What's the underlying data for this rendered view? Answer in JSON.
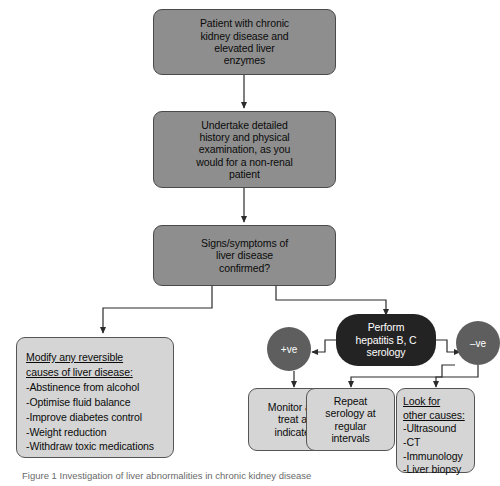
{
  "diagram": {
    "colors": {
      "node_dark_fill": "#8e8e8e",
      "node_light_fill": "#d5d5d5",
      "node_black_fill": "#232323",
      "circle_fill": "#5e5e5e",
      "border": "#4a4a4a",
      "edge": "#2b2b2b",
      "background": "#ffffff",
      "caption_text": "#6a6a6a"
    },
    "nodes": {
      "start": {
        "lines": [
          "Patient with chronic",
          "kidney disease and",
          "elevated liver",
          "enzymes"
        ],
        "style": "dark"
      },
      "history": {
        "lines": [
          "Undertake detailed",
          "history and physical",
          "examination, as you",
          "would for a non-renal",
          "patient"
        ],
        "style": "dark"
      },
      "decision": {
        "lines": [
          "Signs/symptoms of",
          "liver disease",
          "confirmed?"
        ],
        "style": "dark"
      },
      "modify": {
        "heading": [
          "Modify any reversible",
          "causes of liver disease:"
        ],
        "items": [
          "-Abstinence from alcohol",
          "-Optimise fluid balance",
          "-Improve diabetes control",
          "-Weight reduction",
          "-Withdraw toxic medications"
        ],
        "style": "light"
      },
      "serology": {
        "lines": [
          "Perform",
          "hepatitis B, C",
          "serology"
        ],
        "style": "black"
      },
      "positive": {
        "label": "+ve",
        "style": "circle"
      },
      "negative": {
        "label": "–ve",
        "style": "circle"
      },
      "monitor": {
        "lines": [
          "Monitor and",
          "treat as",
          "indicated"
        ],
        "style": "light"
      },
      "repeat": {
        "lines": [
          "Repeat",
          "serology at",
          "regular",
          "intervals"
        ],
        "style": "light"
      },
      "other_causes": {
        "heading": [
          "Look for",
          "other causes:"
        ],
        "items": [
          "-Ultrasound",
          "-CT",
          "-Immunology",
          "-Liver biopsy"
        ],
        "style": "light"
      }
    },
    "caption": "Figure 1 Investigation of liver abnormalities in chronic kidney disease"
  }
}
